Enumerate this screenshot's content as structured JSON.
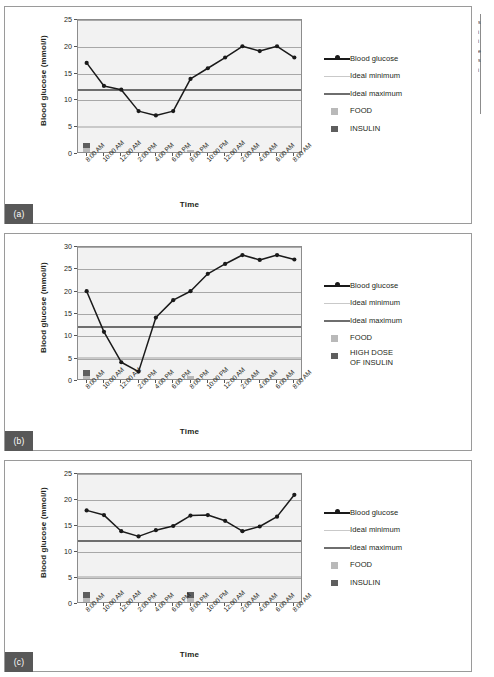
{
  "figure": {
    "edge_text_lines": [
      "s",
      "i",
      "i",
      "e",
      "s",
      "i"
    ]
  },
  "panels": [
    {
      "tag": "(a)",
      "legend": [
        {
          "key": "line-marker",
          "label": "Blood glucose"
        },
        {
          "key": "line-light",
          "label": "Ideal minimum"
        },
        {
          "key": "line-dark",
          "label": "Ideal maximum"
        },
        {
          "key": "square-light",
          "label": "FOOD"
        },
        {
          "key": "square-dark",
          "label": "INSULIN"
        }
      ],
      "chart_data": {
        "type": "line",
        "title": "",
        "xlabel": "Time",
        "ylabel": "Blood glucose (mmol/l)",
        "ylim": [
          0,
          25
        ],
        "yticks": [
          0,
          5,
          10,
          15,
          20,
          25
        ],
        "grid": true,
        "legend_position": "right",
        "categories": [
          "8:00 AM",
          "10:00 AM",
          "12:00 AM",
          "2:00 PM",
          "4:00 PM",
          "6:00 PM",
          "8:00 PM",
          "10:00 PM",
          "12:00 AM",
          "2:00 AM",
          "4:00 AM",
          "6:00 AM",
          "8:00 AM"
        ],
        "series": [
          {
            "name": "Blood glucose",
            "values": [
              17.0,
              12.7,
              12.0,
              8.0,
              7.2,
              8.0,
              14.0,
              16.0,
              18.0,
              20.1,
              19.2,
              20.1,
              18.0
            ]
          }
        ],
        "reference_lines": [
          {
            "name": "Ideal minimum",
            "value": 5.0,
            "color": "#c9c9c9"
          },
          {
            "name": "Ideal maximum",
            "value": 12.0,
            "color": "#6e6e6e"
          }
        ],
        "events": [
          {
            "category": "8:00 AM",
            "food": 1.1,
            "insulin_from": 1.1,
            "insulin_to": 2.1
          },
          {
            "category": "8:00 PM",
            "food": 0.8,
            "insulin_from": 0,
            "insulin_to": 0
          }
        ]
      }
    },
    {
      "tag": "(b)",
      "legend": [
        {
          "key": "line-marker",
          "label": "Blood glucose"
        },
        {
          "key": "line-light",
          "label": "Ideal minimum"
        },
        {
          "key": "line-dark",
          "label": "Ideal maximum"
        },
        {
          "key": "square-light",
          "label": "FOOD"
        },
        {
          "key": "square-dark",
          "label": "HIGH DOSE\nOF INSULIN"
        }
      ],
      "chart_data": {
        "type": "line",
        "title": "",
        "xlabel": "Time",
        "ylabel": "Blood glucose (mmol/l)",
        "ylim": [
          0,
          30
        ],
        "yticks": [
          0,
          5,
          10,
          15,
          20,
          25,
          30
        ],
        "grid": true,
        "legend_position": "right",
        "categories": [
          "8:00 AM",
          "10:00 AM",
          "12:00 AM",
          "2:00 PM",
          "4:00 PM",
          "6:00 PM",
          "8:00 PM",
          "10:00 PM",
          "12:00 AM",
          "2:00 AM",
          "4:00 AM",
          "6:00 AM",
          "8:00 AM"
        ],
        "series": [
          {
            "name": "Blood glucose",
            "values": [
              20.1,
              11.0,
              4.2,
              2.1,
              14.2,
              18.1,
              20.1,
              24.0,
              26.2,
              28.2,
              27.1,
              28.2,
              27.2
            ]
          }
        ],
        "reference_lines": [
          {
            "name": "Ideal minimum",
            "value": 5.1,
            "color": "#c9c9c9"
          },
          {
            "name": "Ideal maximum",
            "value": 12.0,
            "color": "#6e6e6e"
          }
        ],
        "events": [
          {
            "category": "8:00 AM",
            "food": 1.2,
            "insulin_from": 1.2,
            "insulin_to": 2.4
          },
          {
            "category": "8:00 PM",
            "food": 1.1,
            "insulin_from": 0,
            "insulin_to": 0
          }
        ]
      }
    },
    {
      "tag": "(c)",
      "legend": [
        {
          "key": "line-marker",
          "label": "Blood glucose"
        },
        {
          "key": "line-light",
          "label": "Ideal minimum"
        },
        {
          "key": "line-dark",
          "label": "Ideal maximum"
        },
        {
          "key": "square-light",
          "label": "FOOD"
        },
        {
          "key": "square-dark",
          "label": "INSULIN"
        }
      ],
      "chart_data": {
        "type": "line",
        "title": "",
        "xlabel": "Time",
        "ylabel": "Blood glucose (mmol/l)",
        "ylim": [
          0,
          25
        ],
        "yticks": [
          0,
          5,
          10,
          15,
          20,
          25
        ],
        "grid": true,
        "legend_position": "right",
        "categories": [
          "8:00 AM",
          "10:00 AM",
          "12:00 AM",
          "2:00 PM",
          "4:00 PM",
          "6:00 PM",
          "8:00 PM",
          "10:00 PM",
          "12:00 AM",
          "2:00 AM",
          "4:00 AM",
          "6:00 AM",
          "8:00 AM"
        ],
        "series": [
          {
            "name": "Blood glucose",
            "values": [
              18.0,
              17.1,
              14.0,
              13.0,
              14.2,
              15.0,
              17.0,
              17.1,
              16.0,
              14.0,
              14.9,
              16.8,
              21.0
            ]
          }
        ],
        "reference_lines": [
          {
            "name": "Ideal minimum",
            "value": 5.1,
            "color": "#c9c9c9"
          },
          {
            "name": "Ideal maximum",
            "value": 12.2,
            "color": "#6e6e6e"
          }
        ],
        "events": [
          {
            "category": "8:00 AM",
            "food": 1.2,
            "insulin_from": 1.2,
            "insulin_to": 2.4
          },
          {
            "category": "8:00 PM",
            "food": 1.2,
            "insulin_from": 1.2,
            "insulin_to": 2.4
          }
        ]
      }
    }
  ]
}
